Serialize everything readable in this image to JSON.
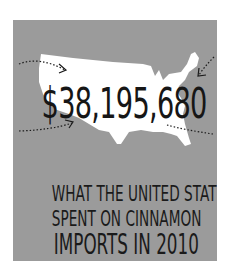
{
  "infographic": {
    "amount": "$38,195,680",
    "caption": {
      "line1": "WHAT THE UNITED STATES",
      "line2": "SPENT ON CINNAMON",
      "line3": "IMPORTS IN 2010"
    },
    "colors": {
      "background": "#9b9b9b",
      "map": "#ffffff",
      "text": "#161616"
    },
    "icons": [
      "us-map-silhouette",
      "dotted-arrow-top-left",
      "dotted-arrow-top-right",
      "dotted-arrow-bottom-left",
      "dotted-arrow-bottom-right"
    ]
  }
}
